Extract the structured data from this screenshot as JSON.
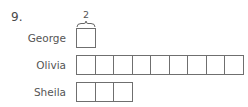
{
  "question": {
    "number": "9.",
    "brace_value": "2",
    "rows": [
      {
        "name": "George",
        "boxes": 1
      },
      {
        "name": "Olivia",
        "boxes": 9
      },
      {
        "name": "Sheila",
        "boxes": 3
      }
    ]
  }
}
